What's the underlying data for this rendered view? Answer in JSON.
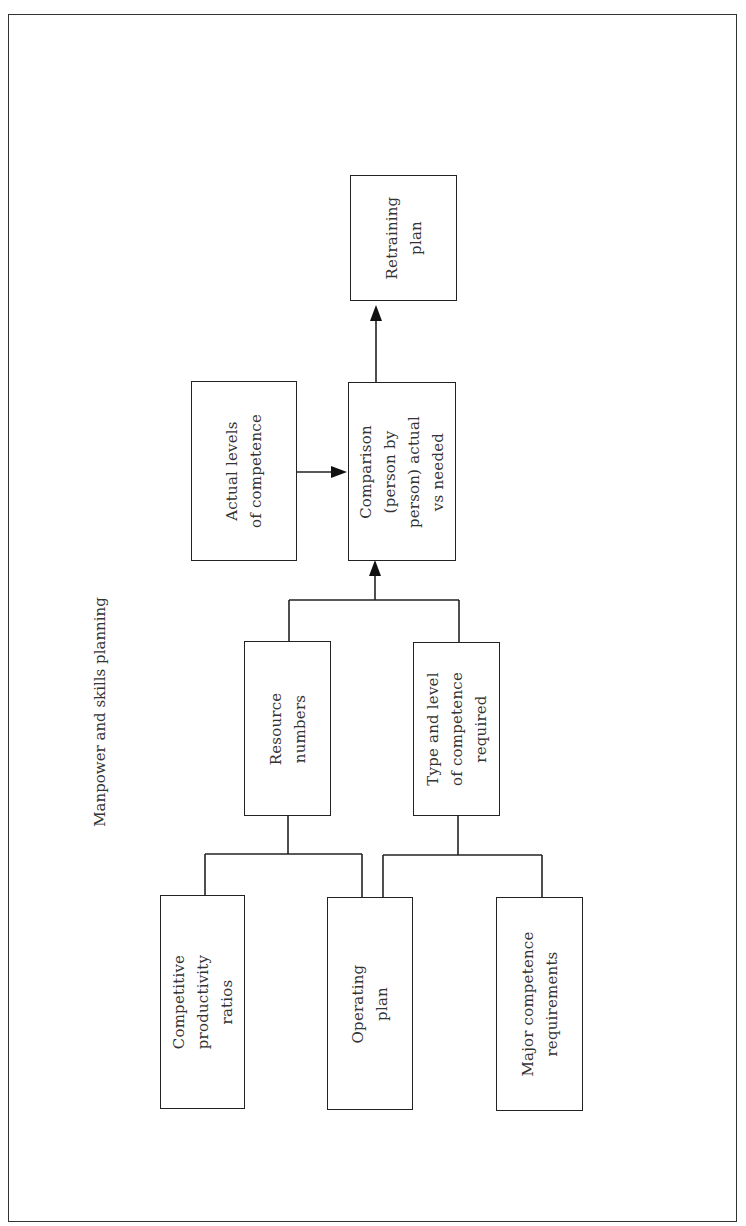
{
  "title": "Manpower and skills planning",
  "nodes": {
    "retraining_plan": "Retraining\nplan",
    "actual_levels": "Actual levels\nof competence",
    "comparison": "Comparison\n(person by\nperson) actual\nvs needed",
    "resource_numbers": "Resource\nnumbers",
    "type_level": "Type and level\nof competence\nrequired",
    "competitive_ratios": "Competitive\nproductivity\nratios",
    "operating_plan": "Operating\nplan",
    "major_competence": "Major competence\nrequirements"
  },
  "edges": [
    {
      "from": "competitive_ratios",
      "to": "resource_numbers"
    },
    {
      "from": "operating_plan",
      "to": "resource_numbers"
    },
    {
      "from": "operating_plan",
      "to": "type_level"
    },
    {
      "from": "major_competence",
      "to": "type_level"
    },
    {
      "from": "resource_numbers",
      "to": "comparison"
    },
    {
      "from": "type_level",
      "to": "comparison"
    },
    {
      "from": "actual_levels",
      "to": "comparison"
    },
    {
      "from": "comparison",
      "to": "retraining_plan"
    }
  ],
  "colors": {
    "line": "#222222",
    "text": "#333333",
    "background": "#ffffff"
  }
}
